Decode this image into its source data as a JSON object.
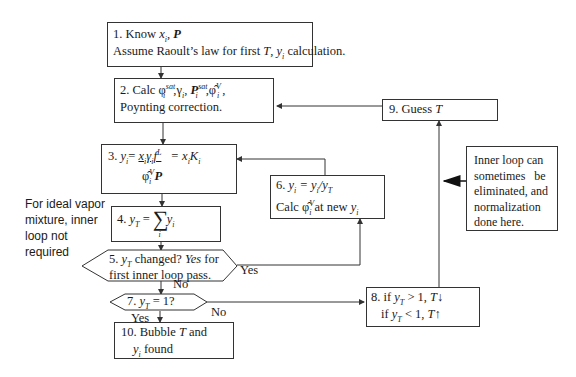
{
  "diagram": {
    "type": "flowchart",
    "nodes": {
      "n1": {
        "line1_prefix": "1. Know ",
        "line1_vars": "x",
        "line1_sub": "i",
        "line1_sep": ", ",
        "line1_P": "P",
        "line2_a": "Assume Raoult’s law for first ",
        "line2_T": "T",
        "line2_b": ", ",
        "line2_y": "y",
        "line2_sub": "i",
        "line2_c": " calculation."
      },
      "n2": {
        "prefix": "2. Calc ",
        "phi": "φ",
        "phi_sup": "sat",
        "phi_sub": "i",
        "gamma": ",γ",
        "gamma_sub": "i",
        "comma": ", ",
        "P": "P",
        "P_sup": "sat",
        "P_sub": "i",
        "phihat": ",φ̂",
        "phihat_sup": "V",
        "phihat_sub": "i",
        "tail": " ,",
        "line2": "Poynting correction."
      },
      "n3": {
        "prefix": "3. ",
        "y": "y",
        "y_sub": "i",
        "eq": "= ",
        "num": "x",
        "num_sub": "i",
        "gam": "γ",
        "gam_sub": "i",
        "f": "f",
        "f_sup": "L",
        "f_sub": "i",
        "eq2": " = x",
        "eq2_sub": "i",
        "K": "K",
        "K_sub": "i",
        "den_phi": "φ̂",
        "den_sup": "V",
        "den_sub": "i",
        "den_P": " P"
      },
      "n4": {
        "prefix": "4. ",
        "y": "y",
        "y_sub": "T",
        "eq": " = ",
        "sum": "∑",
        "sum_sub": "i",
        "yi": "y",
        "yi_sub": "i"
      },
      "n5": {
        "prefix": "5. ",
        "y": "y",
        "y_sub": "T",
        "a": " changed? ",
        "yes": "Yes",
        "b": " for",
        "line2": "first inner loop pass."
      },
      "n6": {
        "prefix": "6. ",
        "y": "y",
        "y_sub": "i",
        "eq": " = y",
        "eq_sub": "i",
        "div": "/y",
        "div_sub": "T",
        "calc": "Calc ",
        "phihat": "φ̂",
        "phihat_sup": "V",
        "phihat_sub": "i",
        "tail": "  at new ",
        "ty": "y",
        "ty_sub": "i"
      },
      "n7": {
        "prefix": "7. ",
        "y": "y",
        "y_sub": "T",
        "tail": " = 1?"
      },
      "n8": {
        "l1a": "8. if ",
        "l1y": "y",
        "l1sub": "T",
        "l1b": " > 1, ",
        "l1T": "T",
        "l1arrow": "↓",
        "l2a": "if ",
        "l2y": "y",
        "l2sub": "T",
        "l2b": " < 1, ",
        "l2T": "T",
        "l2arrow": "↑"
      },
      "n9": {
        "label": "9. Guess ",
        "T": "T"
      },
      "n10": {
        "l1": "10. Bubble ",
        "T": "T",
        "l1b": " and",
        "y": "y",
        "y_sub": "i",
        "l2": " found"
      }
    },
    "edge_labels": {
      "yes_5": "Yes",
      "no_5": "No",
      "no_7": "No",
      "yes_7": "Yes"
    },
    "notes": {
      "left": [
        "For ideal vapor",
        "mixture, inner",
        "loop not",
        "required"
      ],
      "right": [
        "Inner loop can",
        "sometimes   be",
        "eliminated, and",
        "normalization",
        "done here."
      ]
    }
  }
}
